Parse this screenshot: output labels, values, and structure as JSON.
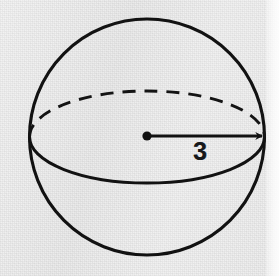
{
  "figure": {
    "kind": "geometry-diagram",
    "background_color": "#eeeeee",
    "ink_color": "#111111",
    "labels": {
      "radius": "3"
    },
    "geometry": {
      "circle": {
        "cx": 147,
        "cy": 137,
        "r": 118,
        "stroke_width": 3,
        "style": "solid"
      },
      "equator_ellipse": {
        "cx": 147,
        "cy": 137,
        "rx": 118,
        "ry": 46,
        "stroke_width": 3,
        "upper_half_style": "dashed",
        "lower_half_style": "solid",
        "dash_length": 13,
        "dash_gap": 9
      },
      "radius_arrow": {
        "from": [
          147,
          136
        ],
        "to": [
          265,
          136
        ],
        "stroke_width": 3,
        "arrowhead": "right",
        "center_dot_radius": 4.5
      }
    }
  }
}
